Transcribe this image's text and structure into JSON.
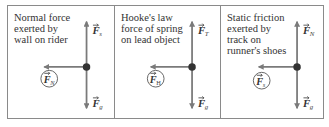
{
  "colors": {
    "border": "#8a8a8a",
    "arrow": "#7a7a7a",
    "dot": "#333333",
    "text": "#333333"
  },
  "panels": [
    {
      "caption": "Normal force\nexerted by\nwall on rider",
      "forces": {
        "up": {
          "symbol": "F",
          "subscript": "s"
        },
        "down": {
          "symbol": "F",
          "subscript": "g"
        },
        "left": {
          "symbol": "F",
          "subscript": "N",
          "circled": true
        }
      }
    },
    {
      "caption": "Hooke's law\nforce of spring\non lead object",
      "forces": {
        "up": {
          "symbol": "F",
          "subscript": "T"
        },
        "down": {
          "symbol": "F",
          "subscript": "g"
        },
        "left": {
          "symbol": "F",
          "subscript": "H",
          "circled": true
        }
      }
    },
    {
      "caption": "Static friction\nexerted by\ntrack on\nrunner's shoes",
      "forces": {
        "up": {
          "symbol": "F",
          "subscript": "N"
        },
        "down": {
          "symbol": "F",
          "subscript": "g"
        },
        "left": {
          "symbol": "F",
          "subscript": "s",
          "circled": true
        }
      }
    }
  ]
}
